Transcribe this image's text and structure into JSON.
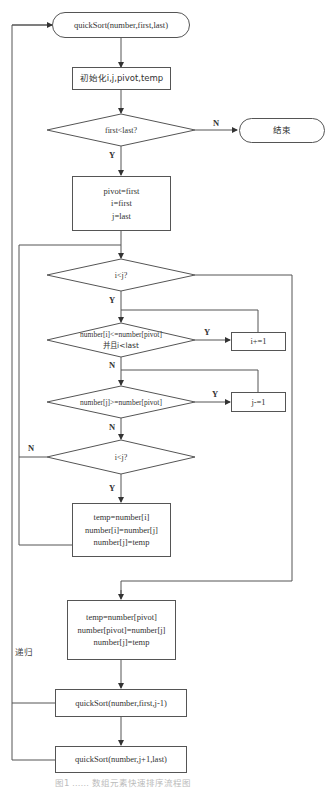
{
  "diagram": {
    "type": "flowchart",
    "title_caption": "图1  ……  数组元素快速排序流程图",
    "nodes": {
      "start": {
        "shape": "terminator",
        "label": "quickSort(number,first,last)"
      },
      "init": {
        "shape": "process",
        "label": "初始化i,j,pivot,temp"
      },
      "cond_first_last": {
        "shape": "decision",
        "label": "first<last?"
      },
      "end": {
        "shape": "terminator",
        "label": "结束"
      },
      "assign": {
        "shape": "process",
        "lines": [
          "pivot=first",
          "i=first",
          "j=last"
        ]
      },
      "cond_i_lt_j_1": {
        "shape": "decision",
        "label": "i<j?"
      },
      "cond_scan_i": {
        "shape": "decision",
        "lines": [
          "number[i]<=number[pivot]",
          "并且i<last"
        ]
      },
      "inc_i": {
        "shape": "process",
        "label": "i+=1"
      },
      "cond_scan_j": {
        "shape": "decision",
        "label": "number[j]>=number[pivot]"
      },
      "dec_j": {
        "shape": "process",
        "label": "j-=1"
      },
      "cond_i_lt_j_2": {
        "shape": "decision",
        "label": "i<j?"
      },
      "swap_ij": {
        "shape": "process",
        "lines": [
          "temp=number[i]",
          "number[i]=number[j]",
          "number[j]=temp"
        ]
      },
      "swap_pivot": {
        "shape": "process",
        "lines": [
          "temp=number[pivot]",
          "number[pivot]=number[j]",
          "number[j]=temp"
        ]
      },
      "recurse_left": {
        "shape": "process",
        "label": "quickSort(number,first,j-1)"
      },
      "recurse_right": {
        "shape": "process",
        "label": "quickSort(number,j+1,last)"
      }
    },
    "edge_labels": {
      "first_last_no": "N",
      "first_last_yes": "Y",
      "i_lt_j_1_yes": "Y",
      "scan_i_yes": "Y",
      "scan_i_no": "N",
      "scan_j_yes": "Y",
      "scan_j_no": "N",
      "i_lt_j_2_no": "N",
      "i_lt_j_2_yes": "Y",
      "recursion": "递归"
    },
    "colors": {
      "stroke": "#555555",
      "text": "#333333",
      "background": "#ffffff"
    }
  }
}
